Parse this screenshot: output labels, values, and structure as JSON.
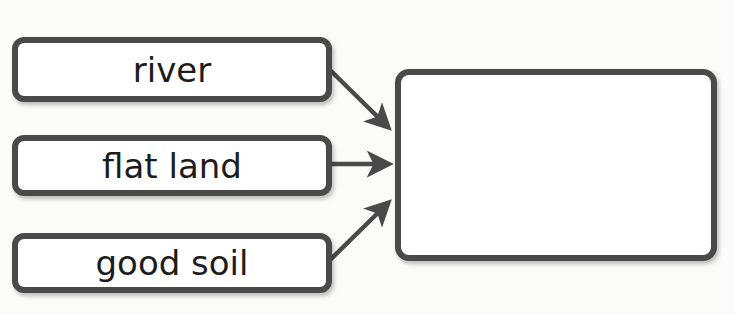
{
  "diagram": {
    "type": "cause-effect graphic organizer",
    "inputs": [
      {
        "label": "river"
      },
      {
        "label": "flat land"
      },
      {
        "label": "good soil"
      }
    ],
    "output": {
      "label": ""
    },
    "colors": {
      "border": "#4a4a4a",
      "text": "#1c1c1c",
      "background": "#fbfbfa",
      "box_fill": "#ffffff"
    }
  }
}
